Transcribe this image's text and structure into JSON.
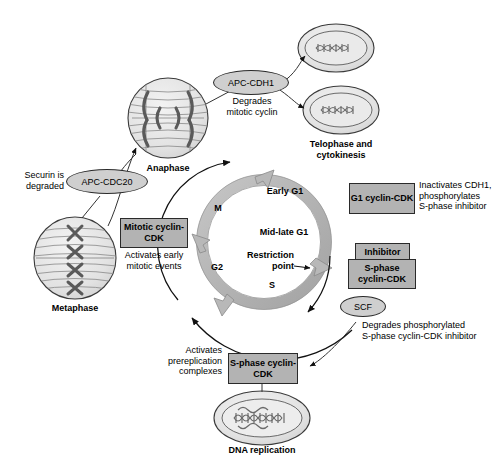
{
  "diagram": {
    "background": "#ffffff",
    "colors": {
      "box_fill": "#b3b3b3",
      "ellipse_fill": "#cfcfcf",
      "ring_fill": "#b8b8b8",
      "cell_fill": "#e6e6e6",
      "stroke": "#2a2a2a",
      "chromosome": "#6b6b6b"
    }
  },
  "cycle_ring": {
    "phases": [
      {
        "label": "Early G1"
      },
      {
        "label": "Mid-late G1"
      },
      {
        "label": "Restriction\npoint"
      },
      {
        "label": "S"
      },
      {
        "label": "G2"
      },
      {
        "label": "M"
      }
    ]
  },
  "cells": [
    {
      "name": "anaphase",
      "label": "Anaphase"
    },
    {
      "name": "metaphase",
      "label": "Metaphase"
    },
    {
      "name": "telophase",
      "label": "Telophase and\ncytokinesis"
    },
    {
      "name": "dna-replication",
      "label": "DNA replication"
    }
  ],
  "complexes": [
    {
      "name": "apc-cdh1",
      "label": "APC-CDH1",
      "annotation": "Degrades\nmitotic cyclin"
    },
    {
      "name": "apc-cdc20",
      "label": "APC-CDC20",
      "annotation": "Securin is\ndegraded"
    },
    {
      "name": "scf",
      "label": "SCF",
      "annotation": "Degrades phosphorylated\nS-phase cyclin-CDK inhibitor"
    }
  ],
  "boxes": [
    {
      "name": "mitotic-cyclin-cdk",
      "label": "Mitotic\ncyclin-CDK",
      "annotation": "Activates early\nmitotic events"
    },
    {
      "name": "g1-cyclin-cdk",
      "label": "G1\ncyclin-CDK",
      "annotation": "Inactivates CDH1,\nphosphorylates\nS-phase inhibitor"
    },
    {
      "name": "inhibitor",
      "label": "Inhibitor",
      "annotation": ""
    },
    {
      "name": "s-phase-cyclin-cdk-right",
      "label": "S-phase\ncyclin-CDK",
      "annotation": ""
    },
    {
      "name": "s-phase-cyclin-cdk-bottom",
      "label": "S-phase\ncyclin-CDK",
      "annotation": "Activates\nprereplication\ncomplexes"
    }
  ]
}
